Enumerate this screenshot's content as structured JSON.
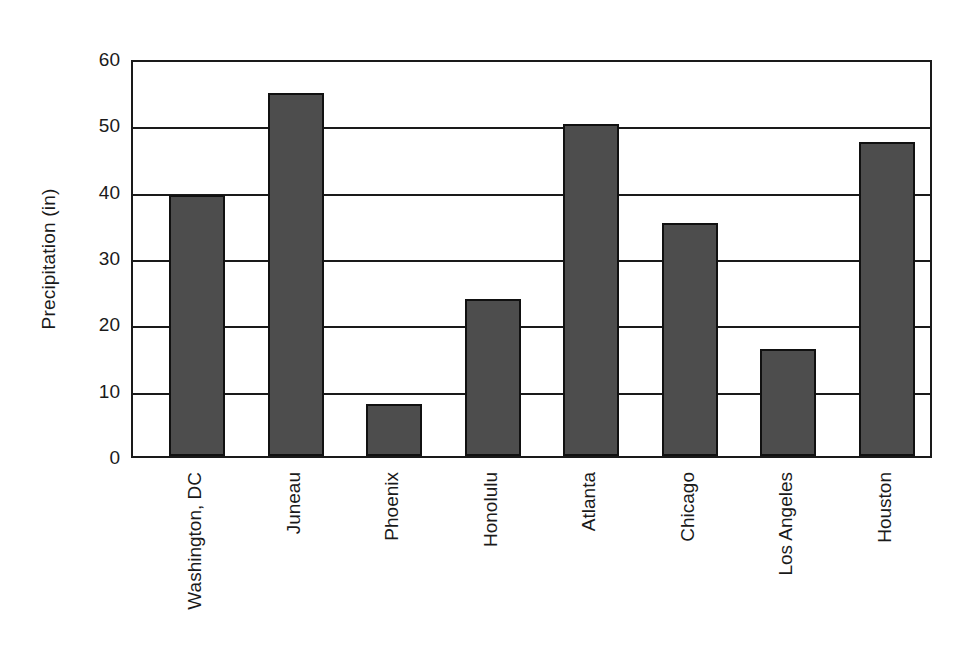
{
  "chart_data": {
    "type": "bar",
    "title": "",
    "xlabel": "",
    "ylabel": "Precipitation (in)",
    "categories": [
      "Washington, DC",
      "Juneau",
      "Phoenix",
      "Honolulu",
      "Atlanta",
      "Chicago",
      "Los Angeles",
      "Houston"
    ],
    "values": [
      39.4,
      54.7,
      7.8,
      23.7,
      50.0,
      35.1,
      16.1,
      47.3
    ],
    "ylim": [
      0,
      60
    ],
    "yticks": [
      0,
      10,
      20,
      30,
      40,
      50,
      60
    ],
    "ytick_labels": [
      "0",
      "10",
      "20",
      "30",
      "40",
      "50",
      "60"
    ],
    "grid": "horizontal",
    "legend": "none",
    "bar_color": "#4d4d4d",
    "bar_edge_color": "#111111",
    "axis_color": "#1a1a1a",
    "background_color": "#ffffff"
  }
}
